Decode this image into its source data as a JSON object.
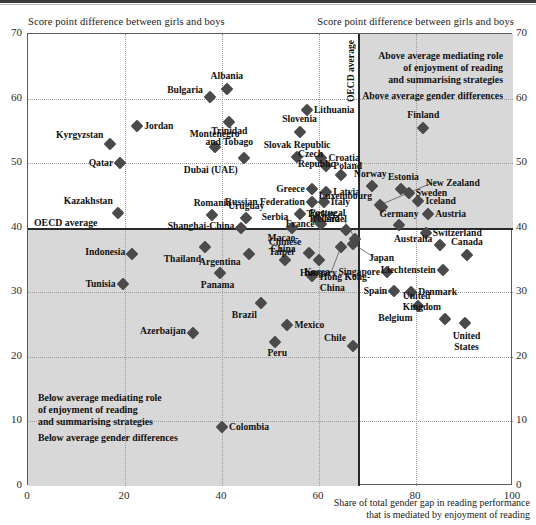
{
  "header": {
    "axis_caption_left": "Score point difference between girls and boys",
    "axis_caption_right": "Score point difference between girls and boys"
  },
  "annotations": {
    "top_right_line1": "Above average mediating role",
    "top_right_line2": "of enjoyment of reading",
    "top_right_line3": "and summarising strategies",
    "top_right_line4": "Above average gender differences",
    "bottom_left_line1": "Below average mediating role",
    "bottom_left_line2": "of enjoyment of reading",
    "bottom_left_line3": "and summarising strategies",
    "bottom_left_line4": "Below average gender differences",
    "oecd_vertical": "OECD average",
    "oecd_horizontal": "OECD average"
  },
  "chart_data": {
    "type": "scatter",
    "title": "",
    "xlabel": "Share of total gender gap in reading performance that is mediated by enjoyment of reading",
    "ylabel": "Score point difference between girls and boys",
    "xlim": [
      0,
      100
    ],
    "ylim": [
      0,
      70
    ],
    "xticks": [
      0,
      20,
      40,
      60,
      80,
      100
    ],
    "yticks": [
      0,
      10,
      20,
      30,
      40,
      50,
      60,
      70
    ],
    "grid": true,
    "legend": "none",
    "reference_lines": {
      "oecd_average_x": 68,
      "oecd_average_y": 40
    },
    "points": [
      {
        "name": "Albania",
        "x": 41.0,
        "y": 61.5,
        "label_pos": "above"
      },
      {
        "name": "Bulgaria",
        "x": 37.5,
        "y": 60.3,
        "label_pos": "left"
      },
      {
        "name": "Lithuania",
        "x": 57.5,
        "y": 58.2,
        "label_pos": "right"
      },
      {
        "name": "Jordan",
        "x": 22.5,
        "y": 55.8,
        "label_pos": "right"
      },
      {
        "name": "Trinidad and Tobago",
        "x": 41.5,
        "y": 56.3,
        "label_pos": "below"
      },
      {
        "name": "Slovenia",
        "x": 56.0,
        "y": 54.8,
        "label_pos": "above"
      },
      {
        "name": "Kyrgyzstan",
        "x": 17.0,
        "y": 53.0,
        "label_pos": "left"
      },
      {
        "name": "Montenegro",
        "x": 38.5,
        "y": 52.5,
        "label_pos": "above"
      },
      {
        "name": "Slovak Republic",
        "x": 55.5,
        "y": 51.0,
        "label_pos": "above"
      },
      {
        "name": "Qatar",
        "x": 19.0,
        "y": 50.0,
        "label_pos": "left"
      },
      {
        "name": "Dubai (UAE)",
        "x": 44.5,
        "y": 50.8,
        "label_pos": "below"
      },
      {
        "name": "Croatia",
        "x": 60.5,
        "y": 50.8,
        "label_pos": "right"
      },
      {
        "name": "Poland",
        "x": 61.5,
        "y": 49.6,
        "label_pos": "right"
      },
      {
        "name": "Czech Republic",
        "x": 64.5,
        "y": 48.2,
        "label_pos": "above"
      },
      {
        "name": "Finland",
        "x": 81.5,
        "y": 55.5,
        "label_pos": "above"
      },
      {
        "name": "Norway",
        "x": 71.0,
        "y": 46.5,
        "label_pos": "above"
      },
      {
        "name": "New Zealand",
        "x": 72.5,
        "y": 43.5,
        "label_pos": "leader"
      },
      {
        "name": "Estonia",
        "x": 77.0,
        "y": 46.0,
        "label_pos": "above"
      },
      {
        "name": "Sweden",
        "x": 78.5,
        "y": 45.4,
        "label_pos": "right"
      },
      {
        "name": "Iceland",
        "x": 80.5,
        "y": 44.2,
        "label_pos": "right"
      },
      {
        "name": "Greece",
        "x": 58.5,
        "y": 46.0,
        "label_pos": "left"
      },
      {
        "name": "Latvia",
        "x": 61.5,
        "y": 45.6,
        "label_pos": "left"
      },
      {
        "name": "Italy",
        "x": 61.0,
        "y": 44.0,
        "label_pos": "right"
      },
      {
        "name": "Russian Federation",
        "x": 58.5,
        "y": 44.0,
        "label_pos": "left"
      },
      {
        "name": "Kazakhstan",
        "x": 18.5,
        "y": 42.3,
        "label_pos": "above"
      },
      {
        "name": "Romania",
        "x": 38.0,
        "y": 42.0,
        "label_pos": "above"
      },
      {
        "name": "Uruguay",
        "x": 45.0,
        "y": 41.5,
        "label_pos": "above"
      },
      {
        "name": "Turkey",
        "x": 56.0,
        "y": 42.1,
        "label_pos": "right"
      },
      {
        "name": "Israel",
        "x": 59.5,
        "y": 41.4,
        "label_pos": "right"
      },
      {
        "name": "Luxembourg",
        "x": 73.0,
        "y": 43.2,
        "label_pos": "below"
      },
      {
        "name": "Austria",
        "x": 82.5,
        "y": 42.2,
        "label_pos": "right"
      },
      {
        "name": "Germany",
        "x": 76.5,
        "y": 40.4,
        "label_pos": "above"
      },
      {
        "name": "Shanghai-China",
        "x": 44.0,
        "y": 40.0,
        "label_pos": "left"
      },
      {
        "name": "Serbia",
        "x": 54.5,
        "y": 40.0,
        "label_pos": "above"
      },
      {
        "name": "France",
        "x": 60.5,
        "y": 40.5,
        "label_pos": "left"
      },
      {
        "name": "Ireland",
        "x": 65.5,
        "y": 39.6,
        "label_pos": "above"
      },
      {
        "name": "Portugal",
        "x": 67.5,
        "y": 38.3,
        "label_pos": "leader"
      },
      {
        "name": "Japan",
        "x": 67.0,
        "y": 37.5,
        "label_pos": "leader"
      },
      {
        "name": "Hungary",
        "x": 64.5,
        "y": 37.0,
        "label_pos": "leader"
      },
      {
        "name": "Switzerland",
        "x": 82.0,
        "y": 39.2,
        "label_pos": "right"
      },
      {
        "name": "Indonesia",
        "x": 21.5,
        "y": 36.0,
        "label_pos": "left"
      },
      {
        "name": "Thailand",
        "x": 36.5,
        "y": 37.0,
        "label_pos": "below"
      },
      {
        "name": "Argentina",
        "x": 45.5,
        "y": 36.0,
        "label_pos": "left"
      },
      {
        "name": "Macao-China",
        "x": 53.0,
        "y": 35.0,
        "label_pos": "above"
      },
      {
        "name": "Chinese Taipei",
        "x": 58.0,
        "y": 36.1,
        "label_pos": "left"
      },
      {
        "name": "Korea",
        "x": 60.0,
        "y": 35.0,
        "label_pos": "below"
      },
      {
        "name": "Australia",
        "x": 85.0,
        "y": 37.4,
        "label_pos": "left"
      },
      {
        "name": "Canada",
        "x": 90.5,
        "y": 35.8,
        "label_pos": "above"
      },
      {
        "name": "Tunisia",
        "x": 19.5,
        "y": 31.3,
        "label_pos": "left"
      },
      {
        "name": "Panama",
        "x": 39.5,
        "y": 33.0,
        "label_pos": "below"
      },
      {
        "name": "Hong Kong-China",
        "x": 58.5,
        "y": 32.5,
        "label_pos": "right"
      },
      {
        "name": "Singapore",
        "x": 74.0,
        "y": 33.2,
        "label_pos": "left"
      },
      {
        "name": "Liechtenstein",
        "x": 85.5,
        "y": 33.5,
        "label_pos": "left"
      },
      {
        "name": "Denmark",
        "x": 79.0,
        "y": 30.0,
        "label_pos": "right"
      },
      {
        "name": "Spain",
        "x": 75.5,
        "y": 30.2,
        "label_pos": "left"
      },
      {
        "name": "Brazil",
        "x": 48.0,
        "y": 28.4,
        "label_pos": "below"
      },
      {
        "name": "Belgium",
        "x": 80.5,
        "y": 27.8,
        "label_pos": "below"
      },
      {
        "name": "United Kingdom",
        "x": 86.0,
        "y": 25.8,
        "label_pos": "above"
      },
      {
        "name": "United States",
        "x": 90.0,
        "y": 25.2,
        "label_pos": "below"
      },
      {
        "name": "Mexico",
        "x": 53.5,
        "y": 25.0,
        "label_pos": "right"
      },
      {
        "name": "Azerbaijan",
        "x": 34.0,
        "y": 23.7,
        "label_pos": "left"
      },
      {
        "name": "Peru",
        "x": 51.0,
        "y": 22.3,
        "label_pos": "below"
      },
      {
        "name": "Chile",
        "x": 67.0,
        "y": 21.7,
        "label_pos": "above"
      },
      {
        "name": "Colombia",
        "x": 40.0,
        "y": 9.2,
        "label_pos": "right"
      }
    ]
  }
}
